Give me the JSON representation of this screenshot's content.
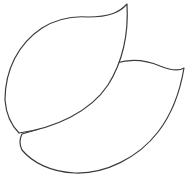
{
  "image": {
    "subject": "two-leaves-outline",
    "style": "line-drawing",
    "background_color": "#ffffff",
    "stroke_color": "#3c3c3c",
    "shapes": [
      {
        "name": "leaf-lower-right",
        "role": "back"
      },
      {
        "name": "leaf-upper-left",
        "role": "front"
      }
    ]
  }
}
